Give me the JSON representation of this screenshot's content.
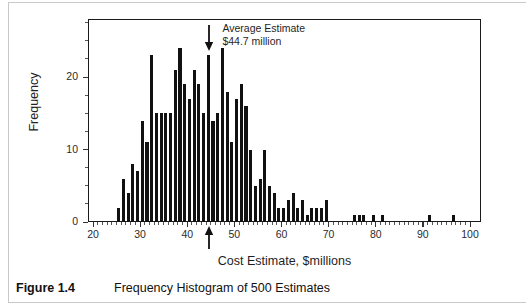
{
  "figure": {
    "caption_label": "Figure 1.4",
    "caption_text": "Frequency Histogram of 500 Estimates"
  },
  "annotation": {
    "line1": "Average Estimate",
    "line2": "$44.7 million",
    "arrow_icon": "down-arrow-icon",
    "mean_marker_icon": "up-arrow-icon"
  },
  "axes": {
    "x_title": "Cost Estimate, $millions",
    "y_title": "Frequency",
    "x_ticks": [
      20,
      30,
      40,
      50,
      60,
      70,
      80,
      90,
      100
    ],
    "y_ticks": [
      0,
      10,
      20
    ]
  },
  "colors": {
    "bar": "#111111",
    "frame": "#1a1a1a",
    "text": "#1f1f1f"
  },
  "chart_data": {
    "type": "bar",
    "title": "Frequency Histogram of 500 Estimates",
    "xlabel": "Cost Estimate, $millions",
    "ylabel": "Frequency",
    "xlim": [
      20,
      100
    ],
    "ylim": [
      0,
      28
    ],
    "grid": false,
    "legend": null,
    "bin_width": 1,
    "annotations": [
      {
        "text": "Average Estimate $44.7 million",
        "x": 44.7,
        "type": "mean-marker"
      }
    ],
    "categories": [
      25.5,
      26.5,
      27.5,
      28.5,
      29.5,
      30.5,
      31.5,
      32.5,
      33.5,
      34.5,
      35.5,
      36.5,
      37.5,
      38.5,
      39.5,
      40.5,
      41.5,
      42.5,
      43.5,
      44.5,
      45.5,
      46.5,
      47.5,
      48.5,
      49.5,
      50.5,
      51.5,
      52.5,
      53.5,
      54.5,
      55.5,
      56.5,
      57.5,
      58.5,
      59.5,
      60.5,
      61.5,
      62.5,
      63.5,
      64.5,
      65.5,
      66.5,
      67.5,
      68.5,
      69.5,
      75.5,
      76.5,
      77.5,
      79.5,
      81.5,
      91.5,
      96.5
    ],
    "values": [
      2,
      6,
      4,
      8,
      7,
      14,
      11,
      23,
      15,
      15,
      15,
      15,
      21,
      24,
      19,
      17,
      21,
      19,
      15,
      23,
      14,
      15,
      24,
      18,
      11,
      17,
      19,
      16,
      10,
      5,
      6,
      10,
      5,
      4,
      2,
      2,
      3,
      4,
      2,
      3,
      1,
      2,
      2,
      2,
      3,
      1,
      1,
      1,
      1,
      1,
      1,
      1
    ]
  }
}
